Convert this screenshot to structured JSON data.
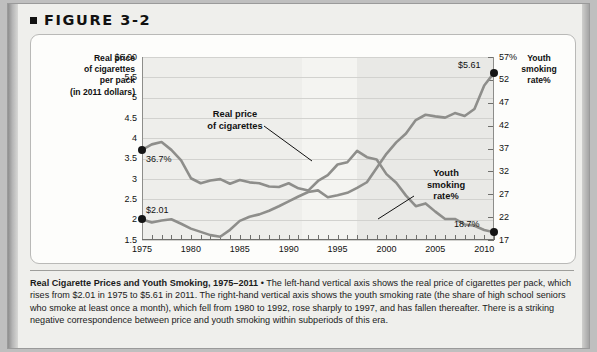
{
  "figure": {
    "label": "FIGURE 3-2",
    "bullet_icon": "square-bullet-icon"
  },
  "axes": {
    "left_title": "Real price\nof cigarettes\nper pack\n(in 2011 dollars)",
    "left_title_lines": [
      "Real price",
      "of cigarettes",
      "per pack",
      "(in 2011 dollars)"
    ],
    "right_title_lines": [
      "Youth",
      "smoking",
      "rate%"
    ],
    "left_ticks": [
      "$6.00",
      "5.5",
      "5",
      "4.5",
      "4",
      "3.5",
      "3",
      "2.5",
      "2",
      "1.5"
    ],
    "right_ticks": [
      "57%",
      "52",
      "47",
      "42",
      "37",
      "32",
      "27",
      "22",
      "17"
    ],
    "x_ticks": [
      "1975",
      "1980",
      "1985",
      "1990",
      "1995",
      "2000",
      "2005",
      "2010"
    ]
  },
  "annotations": {
    "price_label_lines": [
      "Real price",
      "of cigarettes"
    ],
    "youth_label_lines": [
      "Youth",
      "smoking",
      "rate%"
    ],
    "price_start_value": "$2.01",
    "price_end_value": "$5.61",
    "youth_start_value": "36.7%",
    "youth_end_value": "18.7%"
  },
  "caption": {
    "title": "Real Cigarette Prices and Youth Smoking, 1975–2011",
    "separator": " • ",
    "body": "The left-hand vertical axis shows the real price of cigarettes per pack, which rises from $2.01 in 1975 to $5.61 in 2011. The right-hand vertical axis shows the youth smoking rate (the share of high school seniors who smoke at least once a month), which fell from 1980 to 1992, rose sharply to 1997, and has fallen thereafter. There is a striking negative correspondence between price and youth smoking within subperiods of this era."
  },
  "colors": {
    "line": "#8e8e8b",
    "marker": "#141414",
    "plot_background": "#f2f2ef",
    "gridline": "#d2d2cf",
    "card_background": "#fdfdfb",
    "page_background": "#efefec"
  },
  "chart_data": {
    "type": "line",
    "title": "Real Cigarette Prices and Youth Smoking, 1975–2011",
    "xlabel": "",
    "ylabel": "Real price of cigarettes per pack (in 2011 dollars)",
    "ylabel_right": "Youth smoking rate%",
    "xlim": [
      1975,
      2011
    ],
    "ylim": [
      1.5,
      6.0
    ],
    "ylim_right": [
      17,
      57
    ],
    "yticks": [
      1.5,
      2,
      2.5,
      3,
      3.5,
      4,
      4.5,
      5,
      5.5,
      6.0
    ],
    "yticks_right": [
      17,
      22,
      27,
      32,
      37,
      42,
      47,
      52,
      57
    ],
    "xticks": [
      1975,
      1980,
      1985,
      1990,
      1995,
      2000,
      2005,
      2010
    ],
    "grid": true,
    "legend": "annotated-inline",
    "x": [
      1975,
      1976,
      1977,
      1978,
      1979,
      1980,
      1981,
      1982,
      1983,
      1984,
      1985,
      1986,
      1987,
      1988,
      1989,
      1990,
      1991,
      1992,
      1993,
      1994,
      1995,
      1996,
      1997,
      1998,
      1999,
      2000,
      2001,
      2002,
      2003,
      2004,
      2005,
      2006,
      2007,
      2008,
      2009,
      2010,
      2011
    ],
    "series": [
      {
        "name": "Real price of cigarettes",
        "axis": "left",
        "unit": "dollars per pack",
        "values": [
          2.01,
          1.93,
          1.98,
          2.01,
          1.9,
          1.78,
          1.7,
          1.62,
          1.58,
          1.75,
          1.97,
          2.07,
          2.13,
          2.22,
          2.33,
          2.45,
          2.57,
          2.68,
          2.72,
          2.55,
          2.6,
          2.66,
          2.78,
          2.92,
          3.27,
          3.62,
          3.9,
          4.12,
          4.45,
          4.58,
          4.54,
          4.51,
          4.62,
          4.55,
          4.72,
          5.3,
          5.61
        ],
        "start_label": "$2.01",
        "end_label": "$5.61"
      },
      {
        "name": "Youth smoking rate%",
        "axis": "right",
        "unit": "percent",
        "values": [
          36.7,
          37.9,
          38.4,
          36.7,
          34.4,
          30.5,
          29.4,
          30.0,
          30.3,
          29.3,
          30.1,
          29.6,
          29.4,
          28.7,
          28.6,
          29.4,
          28.3,
          27.8,
          29.9,
          31.2,
          33.5,
          34.0,
          36.5,
          35.1,
          34.6,
          31.4,
          29.5,
          26.7,
          24.4,
          25.0,
          23.2,
          21.6,
          21.6,
          20.4,
          20.1,
          19.2,
          18.7
        ],
        "start_label": "36.7%",
        "end_label": "18.7%"
      }
    ]
  }
}
